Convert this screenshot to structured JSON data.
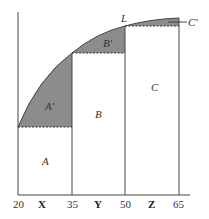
{
  "diagram": {
    "x_ticks": [
      "20",
      "35",
      "50",
      "65"
    ],
    "segment_labels": [
      "X",
      "Y",
      "Z"
    ],
    "region_labels": {
      "A": "A",
      "B": "B",
      "C": "C",
      "A_prime": "A'",
      "B_prime": "B'",
      "C_prime": "C'",
      "curve": "L"
    },
    "colors": {
      "shaded": "#8c8c8c",
      "line": "#333333",
      "background": "#ffffff"
    }
  }
}
